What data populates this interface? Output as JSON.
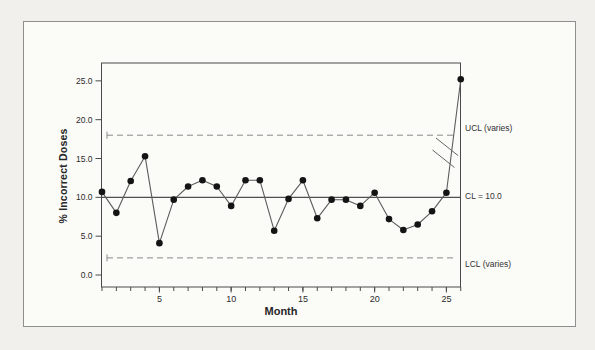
{
  "figure": {
    "border_color": "#8f8f8d",
    "background": "#fbfbf8"
  },
  "chart_data": {
    "type": "line",
    "title": "",
    "xlabel": "Month",
    "ylabel": "% Incorrect Doses",
    "x": [
      1,
      2,
      3,
      4,
      5,
      6,
      7,
      8,
      9,
      10,
      11,
      12,
      13,
      14,
      15,
      16,
      17,
      18,
      19,
      20,
      21,
      22,
      23,
      24,
      25,
      26
    ],
    "series": [
      {
        "name": "percent-incorrect-doses",
        "values": [
          10.7,
          8.0,
          12.1,
          15.3,
          4.1,
          9.7,
          11.4,
          12.2,
          11.4,
          8.9,
          12.2,
          12.2,
          5.7,
          9.8,
          12.2,
          7.3,
          9.7,
          9.7,
          8.9,
          10.6,
          7.2,
          5.8,
          6.5,
          8.2,
          10.6,
          25.2
        ]
      }
    ],
    "center_line": {
      "label": "CL = 10.0",
      "value": 10.0
    },
    "upper_control_limit": {
      "label": "UCL (varies)",
      "value": 18.0
    },
    "lower_control_limit": {
      "label": "LCL (varies)",
      "value": 2.2
    },
    "y_ticks": [
      {
        "value": 0,
        "label": "0.0"
      },
      {
        "value": 5,
        "label": "5.0"
      },
      {
        "value": 10,
        "label": "10.0"
      },
      {
        "value": 15,
        "label": "15.0"
      },
      {
        "value": 20,
        "label": "20.0"
      },
      {
        "value": 25,
        "label": "25.0"
      }
    ],
    "x_ticks": [
      5,
      10,
      15,
      20,
      25
    ],
    "x_minor_ticks": [
      1,
      2,
      3,
      4,
      5,
      6,
      7,
      8,
      9,
      10,
      11,
      12,
      13,
      14,
      15,
      16,
      17,
      18,
      19,
      20,
      21,
      22,
      23,
      24,
      25,
      26
    ],
    "ylim": [
      -1.5,
      27.3
    ],
    "xlim": [
      1,
      26
    ],
    "grid": false,
    "legend": false,
    "scale_break_on_last_segment": true,
    "marker_color": "#141414",
    "line_color": "#5c5c5c",
    "limit_line_color": "#8a8a8a",
    "center_line_color": "#4f4f4f",
    "axis_color": "#4a4a4a"
  }
}
